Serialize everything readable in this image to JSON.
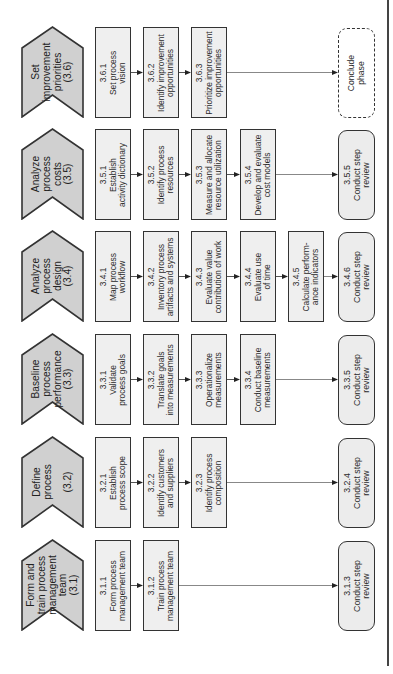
{
  "diagram": {
    "orientation": "rotated -90deg (reads bottom-to-top)",
    "colors": {
      "phase_fill": "#d0d0d0",
      "task_fill": "#efefef",
      "review_fill": "#ececec",
      "border": "#333333",
      "connector": "#888888"
    },
    "phases": [
      {
        "id": "3.6",
        "label_lines": [
          "Set",
          "improvement",
          "priorities",
          "(3.6)"
        ],
        "tasks": [
          {
            "id": "3.6.1",
            "lines": [
              "3.6.1",
              "Set process",
              "vision"
            ]
          },
          {
            "id": "3.6.2",
            "lines": [
              "3.6.2",
              "Identify improvement",
              "opportunities"
            ]
          },
          {
            "id": "3.6.3",
            "lines": [
              "3.6.3",
              "Prioritize improvement",
              "opportunities"
            ]
          }
        ],
        "end": {
          "type": "conclude",
          "lines": [
            "Conclude",
            "phase"
          ]
        }
      },
      {
        "id": "3.5",
        "label_lines": [
          "Analyze",
          "process",
          "costs",
          "(3.5)"
        ],
        "tasks": [
          {
            "id": "3.5.1",
            "lines": [
              "3.5.1",
              "Establish",
              "activity dictionary"
            ]
          },
          {
            "id": "3.5.2",
            "lines": [
              "3.5.2",
              "Identify process",
              "resources"
            ]
          },
          {
            "id": "3.5.3",
            "lines": [
              "3.5.3",
              "Measure and allocate",
              "resource utilization"
            ]
          },
          {
            "id": "3.5.4",
            "lines": [
              "3.5.4",
              "Develop and evaluate",
              "cost models"
            ]
          }
        ],
        "end": {
          "type": "review",
          "lines": [
            "3.5.5",
            "Conduct step",
            "review"
          ]
        }
      },
      {
        "id": "3.4",
        "label_lines": [
          "Analyze",
          "process",
          "design",
          "(3.4)"
        ],
        "tasks": [
          {
            "id": "3.4.1",
            "lines": [
              "3.4.1",
              "Map process",
              "workflow"
            ]
          },
          {
            "id": "3.4.2",
            "lines": [
              "3.4.2",
              "Inventory process",
              "artifacts and systems"
            ]
          },
          {
            "id": "3.4.3",
            "lines": [
              "3.4.3",
              "Evaluate value",
              "contribution of work"
            ]
          },
          {
            "id": "3.4.4",
            "lines": [
              "3.4.4",
              "Evaluate use",
              "of time"
            ]
          },
          {
            "id": "3.4.5",
            "lines": [
              "3.4.5",
              "Calculate perform-",
              "ance indicators"
            ]
          }
        ],
        "end": {
          "type": "review",
          "lines": [
            "3.4.6",
            "Conduct step",
            "review"
          ]
        }
      },
      {
        "id": "3.3",
        "label_lines": [
          "Baseline",
          "process",
          "performance",
          "(3.3)"
        ],
        "tasks": [
          {
            "id": "3.3.1",
            "lines": [
              "3.3.1",
              "Validate",
              "process goals"
            ]
          },
          {
            "id": "3.3.2",
            "lines": [
              "3.3.2",
              "Translate goals",
              "into measurements"
            ]
          },
          {
            "id": "3.3.3",
            "lines": [
              "3.3.3",
              "Operationalize",
              "measurements"
            ]
          },
          {
            "id": "3.3.4",
            "lines": [
              "3.3.4",
              "Conduct baseline",
              "measurements"
            ]
          }
        ],
        "end": {
          "type": "review",
          "lines": [
            "3.3.5",
            "Conduct step",
            "review"
          ]
        }
      },
      {
        "id": "3.2",
        "label_lines": [
          "Define",
          "process",
          "",
          "(3.2)"
        ],
        "tasks": [
          {
            "id": "3.2.1",
            "lines": [
              "3.2.1",
              "Establish",
              "process scope"
            ]
          },
          {
            "id": "3.2.2",
            "lines": [
              "3.2.2",
              "Identify customers",
              "and suppliers"
            ]
          },
          {
            "id": "3.2.3",
            "lines": [
              "3.2.3",
              "Identify process",
              "composition"
            ]
          }
        ],
        "end": {
          "type": "review",
          "lines": [
            "3.2.4",
            "Conduct step",
            "review"
          ]
        }
      },
      {
        "id": "3.1",
        "label_lines": [
          "Form and",
          "train process",
          "management",
          "team",
          "(3.1)"
        ],
        "tasks": [
          {
            "id": "3.1.1",
            "lines": [
              "3.1.1",
              "Form process",
              "management team"
            ]
          },
          {
            "id": "3.1.2",
            "lines": [
              "3.1.2",
              "Train process",
              "management team"
            ]
          }
        ],
        "end": {
          "type": "review",
          "lines": [
            "3.1.3",
            "Conduct step",
            "review"
          ]
        }
      }
    ]
  }
}
